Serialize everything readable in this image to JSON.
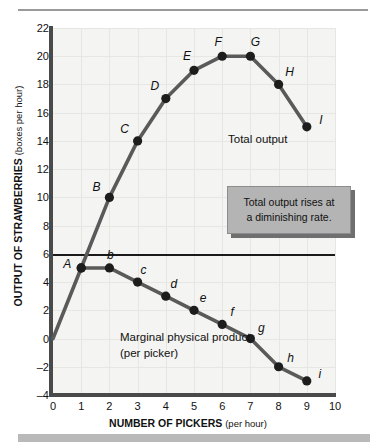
{
  "chart_data": {
    "type": "line",
    "title": "",
    "xlabel": "NUMBER OF PICKERS",
    "xlabel_unit": "(per hour)",
    "ylabel": "OUTPUT OF STRAWBERRIES",
    "ylabel_unit": "(boxes per hour)",
    "xlim": [
      0,
      10
    ],
    "ylim": [
      -4,
      22
    ],
    "xticks": [
      0,
      1,
      2,
      3,
      4,
      5,
      6,
      7,
      8,
      9,
      10
    ],
    "yticks": [
      22,
      20,
      18,
      16,
      14,
      12,
      10,
      8,
      6,
      4,
      2,
      0,
      -2,
      -4
    ],
    "ytick_labels": [
      "22",
      "20",
      "18",
      "16",
      "14",
      "12",
      "10",
      "8",
      "6",
      "4",
      "2",
      "0",
      "–2",
      "–4"
    ],
    "grid": true,
    "legend_position": "inline-annotation",
    "zero_line": 0,
    "series": [
      {
        "name": "Total output",
        "label": "Total output",
        "x": [
          0,
          1,
          2,
          3,
          4,
          5,
          6,
          7,
          8,
          9
        ],
        "values": [
          0,
          5,
          10,
          14,
          17,
          19,
          20,
          20,
          18,
          15
        ],
        "point_labels": [
          "",
          "A",
          "B",
          "C",
          "D",
          "E",
          "F",
          "G",
          "H",
          "I"
        ]
      },
      {
        "name": "Marginal physical product",
        "label": "Marginal physical product",
        "label_line2": "(per picker)",
        "x": [
          1,
          2,
          3,
          4,
          5,
          6,
          7,
          8,
          9
        ],
        "values": [
          5,
          5,
          4,
          3,
          2,
          1,
          0,
          -2,
          -3
        ],
        "point_labels": [
          "A",
          "b",
          "c",
          "d",
          "e",
          "f",
          "g",
          "h",
          "i"
        ]
      }
    ],
    "annotations": [
      {
        "text": "Total output rises at",
        "text_line2": "a diminishing rate."
      }
    ],
    "colors": {
      "plot_background": "#f4f4f2",
      "grid": "#e6e6e3",
      "axis": "#4a4a4a",
      "curve": "#5a5a5a",
      "marker": "#1d1d1d",
      "callout_fill": "#b4b4b4",
      "callout_shadow": "#6f6f6f",
      "page_background": "#ffffff"
    }
  }
}
